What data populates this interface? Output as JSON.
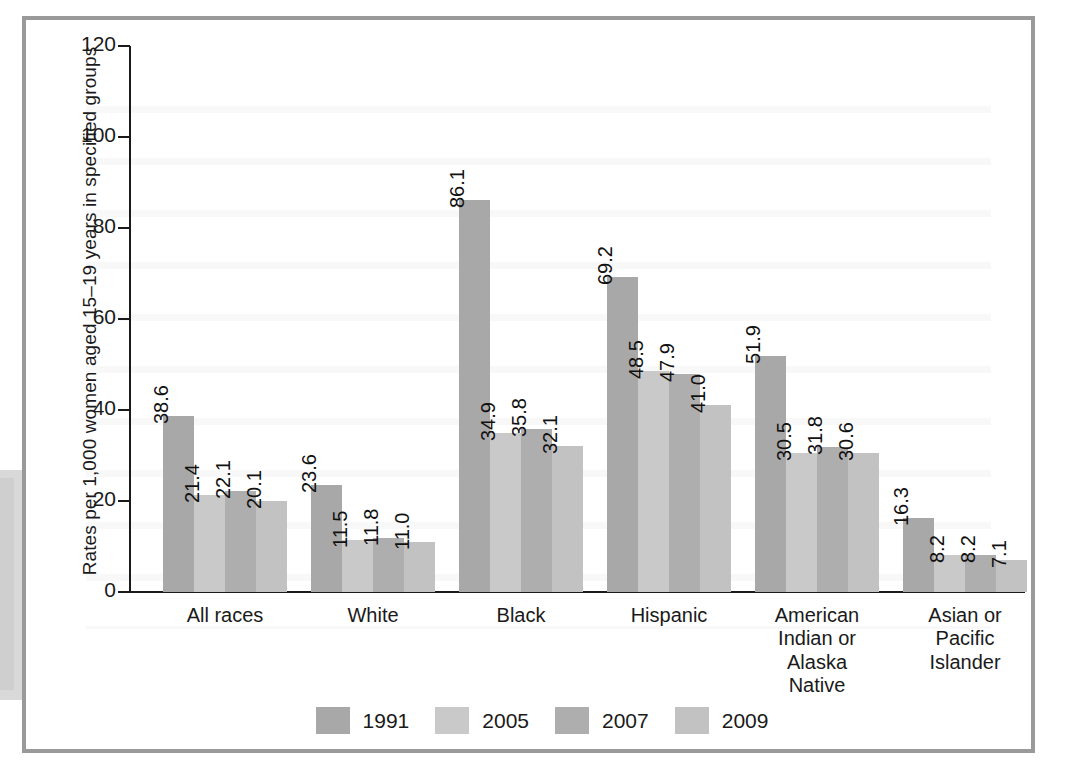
{
  "chart_data": {
    "type": "bar",
    "title": "",
    "subtitle": "",
    "xlabel": "",
    "ylabel": "Rates per 1,000 women aged 15–19 years in specified groups",
    "ylim": [
      0,
      120
    ],
    "yticks": [
      0,
      20,
      40,
      60,
      80,
      100,
      120
    ],
    "grid": false,
    "legend_position": "bottom-center",
    "categories": [
      "All races",
      "White",
      "Black",
      "Hispanic",
      "American\nIndian or\nAlaska\nNative",
      "Asian or\nPacific\nIslander"
    ],
    "series": [
      {
        "name": "1991",
        "color": "#a8a8a8",
        "values": [
          38.6,
          23.6,
          86.1,
          69.2,
          51.9,
          16.3
        ]
      },
      {
        "name": "2005",
        "color": "#c9c9c9",
        "values": [
          21.4,
          11.5,
          34.9,
          48.5,
          30.5,
          8.2
        ]
      },
      {
        "name": "2007",
        "color": "#aeaeae",
        "values": [
          22.1,
          11.8,
          35.8,
          47.9,
          31.8,
          8.2
        ]
      },
      {
        "name": "2009",
        "color": "#c2c2c2",
        "values": [
          20.1,
          11.0,
          32.1,
          41.0,
          30.6,
          7.1
        ]
      }
    ],
    "value_labels": [
      [
        "38.6",
        "21.4",
        "22.1",
        "20.1"
      ],
      [
        "23.6",
        "11.5",
        "11.8",
        "11.0"
      ],
      [
        "86.1",
        "34.9",
        "35.8",
        "32.1"
      ],
      [
        "69.2",
        "48.5",
        "47.9",
        "41.0"
      ],
      [
        "51.9",
        "30.5",
        "31.8",
        "30.6"
      ],
      [
        "16.3",
        "8.2",
        "8.2",
        "7.1"
      ]
    ]
  },
  "axis": {
    "y_tick_labels": [
      "0",
      "20",
      "40",
      "60",
      "80",
      "100",
      "120"
    ],
    "y_axis_title": "Rates per 1,000 women aged 15–19 years in specified groups"
  },
  "legend": {
    "entries": [
      {
        "label": "1991",
        "color": "#a8a8a8"
      },
      {
        "label": "2005",
        "color": "#c9c9c9"
      },
      {
        "label": "2007",
        "color": "#aeaeae"
      },
      {
        "label": "2009",
        "color": "#c2c2c2"
      }
    ]
  },
  "categories": [
    {
      "label": "All races"
    },
    {
      "label": "White"
    },
    {
      "label": "Black"
    },
    {
      "label": "Hispanic"
    },
    {
      "label": "American\nIndian or\nAlaska\nNative"
    },
    {
      "label": "Asian or\nPacific\nIslander"
    }
  ],
  "colors": {
    "frame": "#9a9a9a",
    "axis": "#1a1a1a",
    "text": "#1a1a1a",
    "background": "#ffffff"
  }
}
